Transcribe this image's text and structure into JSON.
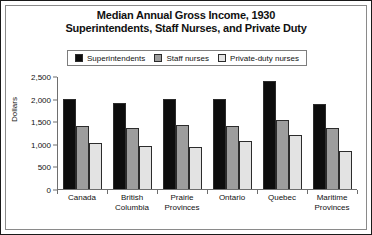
{
  "chart_data": {
    "type": "bar",
    "title": "Median Annual Gross Income, 1930",
    "subtitle": "Superintendents, Staff Nurses, and Private Duty",
    "xlabel": "",
    "ylabel": "Dollars",
    "ylim": [
      0,
      2500
    ],
    "yticks": [
      0,
      500,
      1000,
      1500,
      2000,
      2500
    ],
    "ytick_labels": [
      "0",
      "500",
      "1,000",
      "1,500",
      "2,000",
      "2,500"
    ],
    "grid": false,
    "legend_position": "top-center",
    "categories": [
      "Canada",
      "British Columbia",
      "Prairie Provinces",
      "Ontario",
      "Quebec",
      "Maritime Provinces"
    ],
    "category_lines": [
      [
        "Canada"
      ],
      [
        "British",
        "Columbia"
      ],
      [
        "Prairie",
        "Provinces"
      ],
      [
        "Ontario"
      ],
      [
        "Quebec"
      ],
      [
        "Maritime",
        "Provinces"
      ]
    ],
    "series": [
      {
        "name": "Superintendents",
        "color": "#0d0d0d",
        "values": [
          2000,
          1900,
          2000,
          2000,
          2400,
          1880
        ]
      },
      {
        "name": "Staff nurses",
        "color": "#9d9d9d",
        "values": [
          1400,
          1340,
          1410,
          1400,
          1530,
          1340
        ]
      },
      {
        "name": "Private-duty nurses",
        "color": "#e3e3e3",
        "values": [
          1020,
          960,
          930,
          1060,
          1200,
          830
        ]
      }
    ]
  }
}
